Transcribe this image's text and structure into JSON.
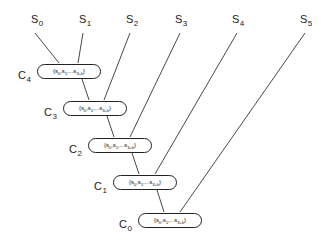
{
  "diagram": {
    "background_color": "#ffffff",
    "line_color": "#333333",
    "node_border_color": "#222222",
    "node_fill_color": "#ffffff",
    "text_color": "#1a1a1a",
    "width": 327,
    "height": 248
  },
  "streams": [
    {
      "id": "s0",
      "label": "S",
      "sub": "0",
      "x": 31,
      "y": 14
    },
    {
      "id": "s1",
      "label": "S",
      "sub": "1",
      "x": 79,
      "y": 14
    },
    {
      "id": "s2",
      "label": "S",
      "sub": "2",
      "x": 126,
      "y": 14
    },
    {
      "id": "s3",
      "label": "S",
      "sub": "3",
      "x": 175,
      "y": 14
    },
    {
      "id": "s4",
      "label": "S",
      "sub": "4",
      "x": 232,
      "y": 14
    },
    {
      "id": "s5",
      "label": "S",
      "sub": "5",
      "x": 300,
      "y": 14
    }
  ],
  "clusters": [
    {
      "id": "c4",
      "label": "C",
      "sub": "4",
      "label_x": 18,
      "label_y": 70,
      "node_x": 37,
      "node_y": 64,
      "node_w": 64
    },
    {
      "id": "c3",
      "label": "C",
      "sub": "3",
      "label_x": 44,
      "label_y": 107,
      "node_x": 63,
      "node_y": 101,
      "node_w": 64
    },
    {
      "id": "c2",
      "label": "C",
      "sub": "2",
      "label_x": 69,
      "label_y": 144,
      "node_x": 88,
      "node_y": 138,
      "node_w": 64
    },
    {
      "id": "c1",
      "label": "C",
      "sub": "1",
      "label_x": 94,
      "label_y": 181,
      "node_x": 113,
      "node_y": 175,
      "node_w": 64
    },
    {
      "id": "c0",
      "label": "C",
      "sub": "0",
      "label_x": 119,
      "label_y": 219,
      "node_x": 138,
      "node_y": 213,
      "node_w": 64
    }
  ],
  "node_text": {
    "open": "{s",
    "first_sub": "0",
    "sep1": ",s",
    "second_sub": "1",
    "ellipsis": ",...s",
    "last_sub": "3+k",
    "close": "}"
  },
  "edges": {
    "stream_feeds": [
      {
        "from": "s0",
        "to": "c4",
        "x1": 35,
        "y1": 33,
        "x2": 59,
        "y2": 63
      },
      {
        "from": "s1",
        "to": "c4",
        "x1": 83,
        "y1": 33,
        "x2": 78,
        "y2": 63
      },
      {
        "from": "s2",
        "to": "c3",
        "x1": 130,
        "y1": 33,
        "x2": 104,
        "y2": 100
      },
      {
        "from": "s3",
        "to": "c2",
        "x1": 180,
        "y1": 33,
        "x2": 130,
        "y2": 137
      },
      {
        "from": "s4",
        "to": "c1",
        "x1": 237,
        "y1": 33,
        "x2": 155,
        "y2": 174
      },
      {
        "from": "s5",
        "to": "c0",
        "x1": 305,
        "y1": 33,
        "x2": 180,
        "y2": 212
      }
    ],
    "cascade": [
      {
        "from": "c4",
        "to": "c3",
        "x1": 82,
        "y1": 79,
        "x2": 89,
        "y2": 100
      },
      {
        "from": "c3",
        "to": "c2",
        "x1": 107,
        "y1": 116,
        "x2": 114,
        "y2": 137
      },
      {
        "from": "c2",
        "to": "c1",
        "x1": 132,
        "y1": 153,
        "x2": 139,
        "y2": 174
      },
      {
        "from": "c1",
        "to": "c0",
        "x1": 157,
        "y1": 190,
        "x2": 164,
        "y2": 212
      }
    ]
  }
}
